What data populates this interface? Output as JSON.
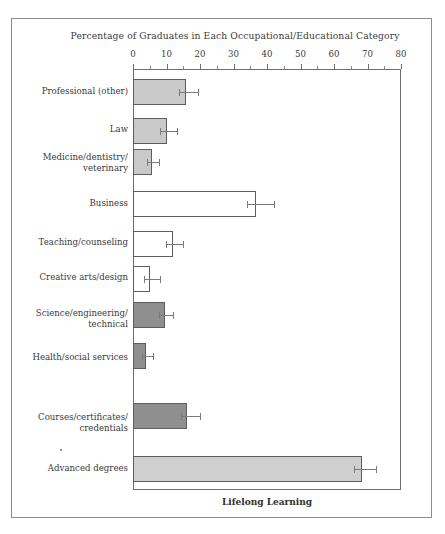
{
  "figure": {
    "title": "Percentage of Graduates in Each Occupational/Educational Category",
    "x_axis_title": "Lifelong Learning",
    "y_axis_title": "Occupation"
  },
  "chart_data": {
    "type": "bar",
    "orientation": "horizontal",
    "title": "Percentage of Graduates in Each Occupational/Educational Category",
    "xlabel": "Lifelong Learning",
    "ylabel": "Occupation",
    "xlim": [
      0,
      80
    ],
    "xticks": [
      0,
      10,
      20,
      30,
      40,
      50,
      60,
      70,
      80
    ],
    "xtick_labels": [
      "0",
      "10",
      "20",
      "30",
      "40",
      "50",
      "60",
      "70",
      "80"
    ],
    "minor_ticks": [
      5,
      15,
      25,
      35,
      45,
      55,
      65,
      75
    ],
    "grid": false,
    "legend": false,
    "error_bars": true,
    "categories": [
      "Professional (other)",
      "Law",
      "Medicine/dentistry/\nveterinary",
      "Business",
      "Teaching/counseling",
      "Creative arts/design",
      "Science/engineering/\ntechnical",
      "Health/social services",
      "Courses/certificates/\ncredentials",
      "Advanced degrees"
    ],
    "values": [
      15.8,
      10.0,
      5.7,
      36.7,
      12.0,
      5.0,
      9.5,
      4.0,
      16.0,
      68.5
    ],
    "err_low": [
      2.0,
      1.8,
      1.4,
      2.8,
      2.2,
      1.8,
      1.6,
      1.2,
      1.8,
      2.6
    ],
    "err_high": [
      3.6,
      3.2,
      2.2,
      5.3,
      3.0,
      3.0,
      2.4,
      2.0,
      4.0,
      4.0
    ],
    "bar_fills": [
      "#c9c9c9",
      "#c9c9c9",
      "#c9c9c9",
      "#ffffff",
      "#ffffff",
      "#ffffff",
      "#8f8f8f",
      "#8f8f8f",
      "#8f8f8f",
      "#cfcfcf"
    ],
    "bar_edge_color": "#5d5d5d",
    "error_bar_color": "#7b7b7b",
    "axis_color": "#6f6f6f",
    "background_color": "#ffffff",
    "bars": [
      {
        "category": "Professional (other)",
        "value": 15.8,
        "err_low": 2.0,
        "err_high": 3.6,
        "fill": "#c9c9c9"
      },
      {
        "category": "Law",
        "value": 10.0,
        "err_low": 1.8,
        "err_high": 3.2,
        "fill": "#c9c9c9"
      },
      {
        "category": "Medicine/dentistry/ veterinary",
        "value": 5.7,
        "err_low": 1.4,
        "err_high": 2.2,
        "fill": "#c9c9c9"
      },
      {
        "category": "Business",
        "value": 36.7,
        "err_low": 2.8,
        "err_high": 5.3,
        "fill": "#ffffff"
      },
      {
        "category": "Teaching/counseling",
        "value": 12.0,
        "err_low": 2.2,
        "err_high": 3.0,
        "fill": "#ffffff"
      },
      {
        "category": "Creative arts/design",
        "value": 5.0,
        "err_low": 1.8,
        "err_high": 3.0,
        "fill": "#ffffff"
      },
      {
        "category": "Science/engineering/ technical",
        "value": 9.5,
        "err_low": 1.6,
        "err_high": 2.4,
        "fill": "#8f8f8f"
      },
      {
        "category": "Health/social services",
        "value": 4.0,
        "err_low": 1.2,
        "err_high": 2.0,
        "fill": "#8f8f8f"
      },
      {
        "category": "Courses/certificates/ credentials",
        "value": 16.0,
        "err_low": 1.8,
        "err_high": 4.0,
        "fill": "#8f8f8f"
      },
      {
        "category": "Advanced degrees",
        "value": 68.5,
        "err_low": 2.6,
        "err_high": 4.0,
        "fill": "#cfcfcf"
      }
    ]
  },
  "labels": {
    "cat0": "Professional (other)",
    "cat1": "Law",
    "cat2_line1": "Medicine/dentistry/",
    "cat2_line2": "veterinary",
    "cat3": "Business",
    "cat4": "Teaching/counseling",
    "cat5": "Creative arts/design",
    "cat6_line1": "Science/engineering/",
    "cat6_line2": "technical",
    "cat7": "Health/social services",
    "cat8_line1": "Courses/certificates/",
    "cat8_line2": "credentials",
    "cat9": "Advanced degrees"
  },
  "ticks": {
    "t0": "0",
    "t10": "10",
    "t20": "20",
    "t30": "30",
    "t40": "40",
    "t50": "50",
    "t60": "60",
    "t70": "70",
    "t80": "80"
  }
}
